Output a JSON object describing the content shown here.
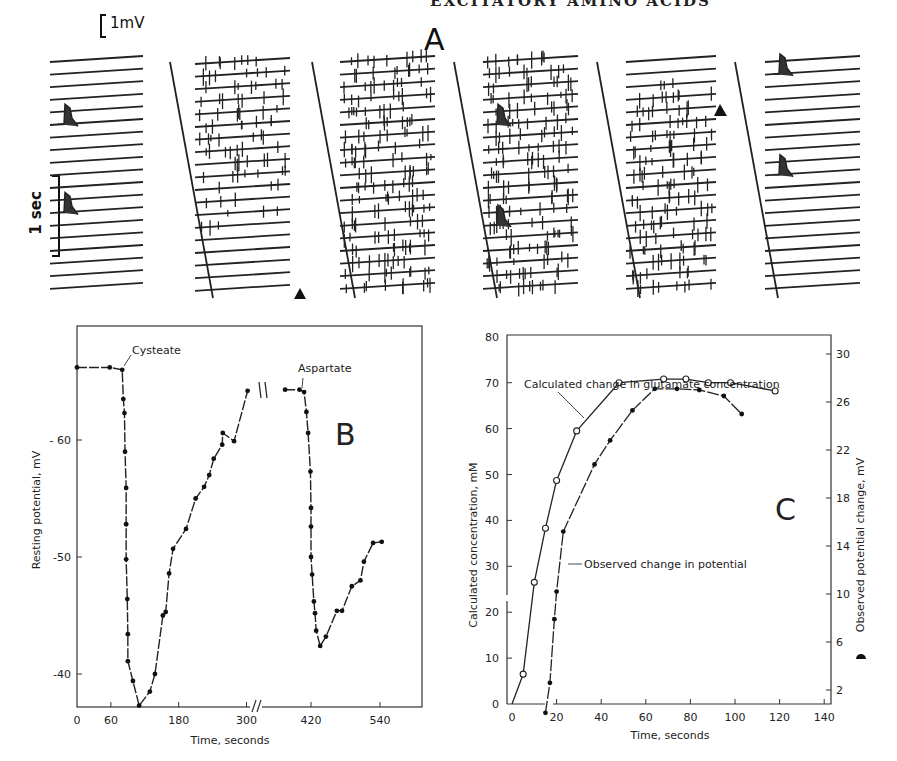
{
  "page": {
    "running_header": "EXCITATORY AMINO ACIDS"
  },
  "panel_a": {
    "letter": "A",
    "scale_voltage": "1mV",
    "scale_time": "1 sec",
    "description": "Six blocks of stacked intracellular recording traces; blocks 1 and 6 show quiet baselines with two large potentials, blocks 2-5 show dense spike activity; filled triangles mark amino acid application start and end",
    "blocks": [
      {
        "id": 1,
        "activity": "quiet",
        "events_rows": [
          5,
          12
        ],
        "marker": null
      },
      {
        "id": 2,
        "activity": "increasing",
        "events_rows": [],
        "marker": "triangle-bottom"
      },
      {
        "id": 3,
        "activity": "dense",
        "events_rows": [],
        "marker": null
      },
      {
        "id": 4,
        "activity": "dense",
        "events_rows": [
          5,
          13
        ],
        "marker": null
      },
      {
        "id": 5,
        "activity": "decreasing",
        "events_rows": [],
        "marker": "triangle-top"
      },
      {
        "id": 6,
        "activity": "quiet",
        "events_rows": [
          1,
          9
        ],
        "marker": null
      }
    ]
  },
  "chart_data": [
    {
      "panel": "B",
      "type": "line",
      "title": "",
      "letter": "B",
      "xlabel": "Time, seconds",
      "ylabel": "Resting potential, mV",
      "xticks": [
        0,
        60,
        180,
        300,
        420,
        540
      ],
      "yticks": [
        -60,
        -50,
        -40
      ],
      "ytick_labels": [
        "- 60",
        "-50",
        "-40"
      ],
      "xlim": [
        0,
        600
      ],
      "ylim": [
        -37.5,
        -69.7
      ],
      "axis_break": {
        "between": [
          300,
          420
        ],
        "x_break_at": 325
      },
      "annotations": [
        {
          "text": "Cysteate",
          "x": 80,
          "y": -66
        },
        {
          "text": "Aspartate",
          "x": 408,
          "y": -64.3
        }
      ],
      "grid": false,
      "series": [
        {
          "name": "Cysteate response",
          "marker": "filled-circle",
          "points": [
            [
              0,
              -66.2
            ],
            [
              58,
              -66.2
            ],
            [
              80,
              -66.0
            ],
            [
              82,
              -63.5
            ],
            [
              84,
              -62.3
            ],
            [
              85,
              -59.0
            ],
            [
              87,
              -55.9
            ],
            [
              87,
              -52.8
            ],
            [
              87,
              -49.8
            ],
            [
              89,
              -46.4
            ],
            [
              90,
              -43.4
            ],
            [
              90,
              -41.1
            ],
            [
              99,
              -39.4
            ],
            [
              110,
              -37.3
            ],
            [
              129,
              -38.5
            ],
            [
              138,
              -40.0
            ],
            [
              152,
              -45.0
            ],
            [
              157,
              -45.3
            ],
            [
              163,
              -48.6
            ],
            [
              170,
              -50.7
            ],
            [
              193,
              -52.4
            ],
            [
              210,
              -55.0
            ],
            [
              225,
              -56.0
            ],
            [
              234,
              -57.0
            ],
            [
              242,
              -58.4
            ],
            [
              257,
              -59.6
            ],
            [
              258,
              -60.6
            ],
            [
              278,
              -59.9
            ],
            [
              302,
              -64.2
            ]
          ]
        },
        {
          "name": "Aspartate response",
          "marker": "filled-circle",
          "points": [
            [
              375,
              -64.3
            ],
            [
              400,
              -64.3
            ],
            [
              408,
              -64.1
            ],
            [
              412,
              -62.4
            ],
            [
              415,
              -60.6
            ],
            [
              419,
              -57.3
            ],
            [
              420,
              -54.2
            ],
            [
              420,
              -52.6
            ],
            [
              420,
              -50.0
            ],
            [
              422,
              -48.5
            ],
            [
              425,
              -46.2
            ],
            [
              427,
              -45.2
            ],
            [
              429,
              -43.7
            ],
            [
              436,
              -42.4
            ],
            [
              446,
              -43.2
            ],
            [
              465,
              -45.4
            ],
            [
              474,
              -45.4
            ],
            [
              491,
              -47.5
            ],
            [
              506,
              -48.0
            ],
            [
              512,
              -49.6
            ],
            [
              528,
              -51.2
            ],
            [
              543,
              -51.3
            ]
          ]
        }
      ]
    },
    {
      "panel": "C",
      "type": "line",
      "title": "",
      "letter": "C",
      "xlabel": "Time, seconds",
      "ylabel": "Calculated concentration, mM",
      "ylabel_right": "Observed potential change, mV",
      "xticks": [
        0,
        20,
        40,
        60,
        80,
        100,
        120,
        140
      ],
      "yticks": [
        0,
        10,
        20,
        30,
        40,
        50,
        60,
        70,
        80
      ],
      "yticks_right": [
        2,
        6,
        10,
        14,
        18,
        22,
        26,
        30
      ],
      "xlim": [
        0,
        142
      ],
      "ylim": [
        0,
        80
      ],
      "ylim_right": [
        0,
        32
      ],
      "grid": false,
      "series": [
        {
          "name": "Calculated change in glutamate concentration",
          "axis": "left",
          "marker": "open-circle",
          "points": [
            [
              0,
              0
            ],
            [
              5,
              6.5
            ],
            [
              10,
              26.5
            ],
            [
              15,
              38.3
            ],
            [
              20,
              48.7
            ],
            [
              29,
              59.5
            ],
            [
              48,
              70
            ],
            [
              68,
              70.8
            ],
            [
              78,
              70.8
            ],
            [
              88,
              70
            ],
            [
              98,
              70
            ],
            [
              118,
              68.2
            ]
          ]
        },
        {
          "name": "Observed change in potential",
          "axis": "right",
          "marker": "filled-circle",
          "points": [
            [
              15,
              0.1
            ],
            [
              17,
              2.6
            ],
            [
              19,
              7.9
            ],
            [
              20,
              10.2
            ],
            [
              23,
              15.2
            ],
            [
              37,
              20.8
            ],
            [
              44,
              22.8
            ],
            [
              54,
              25.3
            ],
            [
              64,
              27.1
            ],
            [
              74,
              27.1
            ],
            [
              84,
              27.0
            ],
            [
              95,
              26.5
            ],
            [
              103,
              25.0
            ]
          ]
        }
      ],
      "labels": [
        {
          "text": "Calculated change in glutamate concentration"
        },
        {
          "text": "Observed change in potential"
        }
      ]
    }
  ]
}
